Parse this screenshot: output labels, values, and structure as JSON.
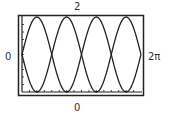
{
  "window": {
    "xmin_label": "0",
    "xmax_label": "2π",
    "ymin_label": "0",
    "ymax_label": "2"
  },
  "chart_data": {
    "type": "line",
    "title": "",
    "xlabel": "",
    "ylabel": "",
    "xlim": [
      0,
      6.2832
    ],
    "ylim": [
      0,
      2
    ],
    "grid": false,
    "legend": null,
    "tick_labels": {
      "x": [
        "0",
        "2π"
      ],
      "y": [
        "0",
        "2"
      ]
    },
    "series": [
      {
        "name": "y = 1 + sin(2x)",
        "expr": "1+sin(2x)",
        "x": [
          0,
          0.7854,
          1.5708,
          2.3562,
          3.1416,
          3.927,
          4.7124,
          5.4978,
          6.2832
        ],
        "values": [
          1,
          2,
          1,
          0,
          1,
          2,
          1,
          0,
          1
        ]
      },
      {
        "name": "y = 1 - sin(2x)",
        "expr": "1-sin(2x)",
        "x": [
          0,
          0.7854,
          1.5708,
          2.3562,
          3.1416,
          3.927,
          4.7124,
          5.4978,
          6.2832
        ],
        "values": [
          1,
          0,
          1,
          2,
          1,
          0,
          1,
          2,
          1
        ]
      }
    ],
    "colors": {
      "curve": "#222222",
      "frame": "#222222",
      "background": "#ffffff"
    }
  }
}
